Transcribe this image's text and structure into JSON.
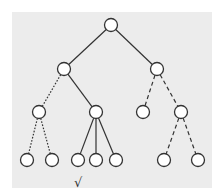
{
  "diagram": {
    "type": "tree",
    "background_color": "#ececec",
    "node_fill": "#ffffff",
    "node_stroke": "#333333",
    "edge_color": "#333333",
    "nodes": [
      {
        "id": "n0",
        "x": 111,
        "y": 25,
        "level": 0
      },
      {
        "id": "n1",
        "x": 64,
        "y": 69,
        "level": 1
      },
      {
        "id": "n2",
        "x": 157,
        "y": 69,
        "level": 1
      },
      {
        "id": "n3",
        "x": 39,
        "y": 112,
        "level": 2
      },
      {
        "id": "n4",
        "x": 96,
        "y": 112,
        "level": 2
      },
      {
        "id": "n5",
        "x": 143,
        "y": 112,
        "level": 2
      },
      {
        "id": "n6",
        "x": 181,
        "y": 112,
        "level": 2
      },
      {
        "id": "n7",
        "x": 27,
        "y": 160,
        "level": 3
      },
      {
        "id": "n8",
        "x": 52,
        "y": 160,
        "level": 3
      },
      {
        "id": "n9",
        "x": 78,
        "y": 160,
        "level": 3
      },
      {
        "id": "n10",
        "x": 96,
        "y": 160,
        "level": 3
      },
      {
        "id": "n11",
        "x": 116,
        "y": 160,
        "level": 3
      },
      {
        "id": "n12",
        "x": 164,
        "y": 160,
        "level": 3
      },
      {
        "id": "n13",
        "x": 198,
        "y": 160,
        "level": 3
      }
    ],
    "edges": [
      {
        "from": "n0",
        "to": "n1",
        "style": "solid"
      },
      {
        "from": "n0",
        "to": "n2",
        "style": "solid"
      },
      {
        "from": "n1",
        "to": "n3",
        "style": "dotted"
      },
      {
        "from": "n1",
        "to": "n4",
        "style": "solid"
      },
      {
        "from": "n2",
        "to": "n5",
        "style": "dashed"
      },
      {
        "from": "n2",
        "to": "n6",
        "style": "dashed"
      },
      {
        "from": "n3",
        "to": "n7",
        "style": "dotted"
      },
      {
        "from": "n3",
        "to": "n8",
        "style": "dotted"
      },
      {
        "from": "n4",
        "to": "n9",
        "style": "solid"
      },
      {
        "from": "n4",
        "to": "n10",
        "style": "solid"
      },
      {
        "from": "n4",
        "to": "n11",
        "style": "solid"
      },
      {
        "from": "n6",
        "to": "n12",
        "style": "dashed"
      },
      {
        "from": "n6",
        "to": "n13",
        "style": "dashed"
      }
    ],
    "annotations": [
      {
        "text": "√",
        "x": 74,
        "y": 176,
        "target": "n9"
      }
    ]
  }
}
